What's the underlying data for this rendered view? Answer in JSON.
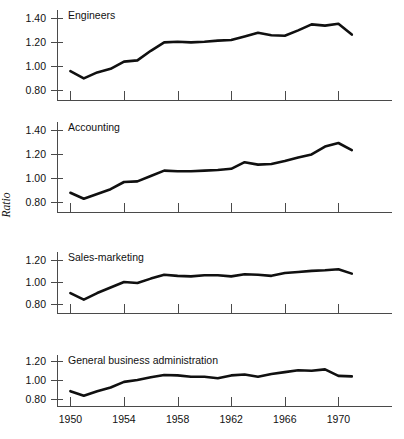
{
  "figure": {
    "ylabel": "Ratio",
    "ylabel_name": "y-axis-title-ratio",
    "background": "#ffffff",
    "line_color": "#101010",
    "axis_color": "#4a4a4a"
  },
  "chart_data": [
    {
      "type": "line",
      "title": "Engineers",
      "xlabel": "",
      "ylabel": "Ratio",
      "xlim": [
        1949.0,
        1974.0
      ],
      "ylim": [
        0.72,
        1.47
      ],
      "grid": false,
      "legend": "none",
      "xticks": [
        1950,
        1954,
        1958,
        1962,
        1966,
        1970
      ],
      "xticklabels": [
        "1950",
        "1954",
        "1958",
        "1962",
        "1966",
        "1970"
      ],
      "yticks": [
        0.8,
        1.0,
        1.2,
        1.4
      ],
      "yticklabels": [
        "0.80",
        "1.00",
        "1.20",
        "1.40"
      ],
      "x": [
        1950,
        1951,
        1952,
        1953,
        1954,
        1955,
        1956,
        1957,
        1958,
        1959,
        1960,
        1961,
        1962,
        1963,
        1964,
        1965,
        1966,
        1967,
        1968,
        1969,
        1970,
        1971
      ],
      "values": [
        0.96,
        0.9,
        0.95,
        0.98,
        1.04,
        1.05,
        1.13,
        1.2,
        1.205,
        1.2,
        1.205,
        1.215,
        1.22,
        1.25,
        1.28,
        1.26,
        1.255,
        1.3,
        1.35,
        1.34,
        1.355,
        1.265
      ]
    },
    {
      "type": "line",
      "title": "Accounting",
      "xlabel": "",
      "ylabel": "Ratio",
      "xlim": [
        1949.0,
        1974.0
      ],
      "ylim": [
        0.72,
        1.47
      ],
      "grid": false,
      "legend": "none",
      "xticks": [
        1950,
        1954,
        1958,
        1962,
        1966,
        1970
      ],
      "xticklabels": [
        "1950",
        "1954",
        "1958",
        "1962",
        "1966",
        "1970"
      ],
      "yticks": [
        0.8,
        1.0,
        1.2,
        1.4
      ],
      "yticklabels": [
        "0.80",
        "1.00",
        "1.20",
        "1.40"
      ],
      "x": [
        1950,
        1951,
        1952,
        1953,
        1954,
        1955,
        1956,
        1957,
        1958,
        1959,
        1960,
        1961,
        1962,
        1963,
        1964,
        1965,
        1966,
        1967,
        1968,
        1969,
        1970,
        1971
      ],
      "values": [
        0.88,
        0.83,
        0.87,
        0.91,
        0.97,
        0.975,
        1.02,
        1.065,
        1.06,
        1.06,
        1.065,
        1.07,
        1.08,
        1.135,
        1.115,
        1.12,
        1.145,
        1.175,
        1.2,
        1.265,
        1.295,
        1.235
      ]
    },
    {
      "type": "line",
      "title": "Sales-marketing",
      "xlabel": "",
      "ylabel": "Ratio",
      "xlim": [
        1949.0,
        1974.0
      ],
      "ylim": [
        0.72,
        1.27
      ],
      "grid": false,
      "legend": "none",
      "xticks": [
        1950,
        1954,
        1958,
        1962,
        1966,
        1970
      ],
      "xticklabels": [
        "1950",
        "1954",
        "1958",
        "1962",
        "1966",
        "1970"
      ],
      "yticks": [
        0.8,
        1.0,
        1.2
      ],
      "yticklabels": [
        "0.80",
        "1.00",
        "1.20"
      ],
      "x": [
        1950,
        1951,
        1952,
        1953,
        1954,
        1955,
        1956,
        1957,
        1958,
        1959,
        1960,
        1961,
        1962,
        1963,
        1964,
        1965,
        1966,
        1967,
        1968,
        1969,
        1970,
        1971
      ],
      "values": [
        0.9,
        0.84,
        0.9,
        0.95,
        1.0,
        0.99,
        1.03,
        1.065,
        1.055,
        1.05,
        1.06,
        1.06,
        1.05,
        1.07,
        1.065,
        1.055,
        1.08,
        1.09,
        1.1,
        1.105,
        1.115,
        1.075
      ]
    },
    {
      "type": "line",
      "title": "General business administration",
      "xlabel": "",
      "ylabel": "Ratio",
      "xlim": [
        1949.0,
        1974.0
      ],
      "ylim": [
        0.72,
        1.27
      ],
      "grid": false,
      "legend": "none",
      "xticks": [
        1950,
        1954,
        1958,
        1962,
        1966,
        1970
      ],
      "xticklabels": [
        "1950",
        "1954",
        "1958",
        "1962",
        "1966",
        "1970"
      ],
      "yticks": [
        0.8,
        1.0,
        1.2
      ],
      "yticklabels": [
        "0.80",
        "1.00",
        "1.20"
      ],
      "x": [
        1950,
        1951,
        1952,
        1953,
        1954,
        1955,
        1956,
        1957,
        1958,
        1959,
        1960,
        1961,
        1962,
        1963,
        1964,
        1965,
        1966,
        1967,
        1968,
        1969,
        1970,
        1971
      ],
      "values": [
        0.88,
        0.83,
        0.88,
        0.92,
        0.98,
        1.0,
        1.03,
        1.055,
        1.05,
        1.035,
        1.035,
        1.02,
        1.05,
        1.06,
        1.035,
        1.065,
        1.085,
        1.105,
        1.1,
        1.115,
        1.045,
        1.04
      ]
    }
  ]
}
